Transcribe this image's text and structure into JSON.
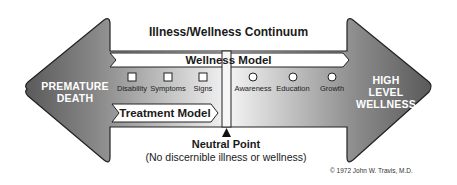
{
  "title": "Illness/Wellness Continuum",
  "left_end": {
    "line1": "PREMATURE",
    "line2": "DEATH"
  },
  "right_end": {
    "line1": "HIGH",
    "line2": "LEVEL",
    "line3": "WELLNESS"
  },
  "wellness_model": {
    "label": "Wellness Model",
    "markers": [
      {
        "label": "Awareness",
        "shape": "circle"
      },
      {
        "label": "Education",
        "shape": "circle"
      },
      {
        "label": "Growth",
        "shape": "circle"
      }
    ]
  },
  "treatment_model": {
    "label": "Treatment Model",
    "markers": [
      {
        "label": "Disability",
        "shape": "square"
      },
      {
        "label": "Symptoms",
        "shape": "square"
      },
      {
        "label": "Signs",
        "shape": "square"
      }
    ]
  },
  "neutral_point": {
    "label": "Neutral Point",
    "description": "(No discernible illness or wellness)"
  },
  "copyright": "© 1972 John W. Travis, M.D.",
  "colors": {
    "arrow_dark": "#555555",
    "arrow_light": "#f2f2f2",
    "outline": "#222222",
    "banner_fill": "#ffffff",
    "end_text": "#ffffff"
  }
}
